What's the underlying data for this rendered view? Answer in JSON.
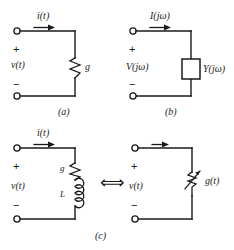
{
  "figure": {
    "background": "#ffffff",
    "ink": "#1a1a1a",
    "panels": [
      {
        "id": "a",
        "caption": "(a)",
        "current_label": "i(t)",
        "voltage_label": "v(t)",
        "plus_sign": "+",
        "minus_sign": "−",
        "element_label": "g",
        "element_type": "resistor-zigzag"
      },
      {
        "id": "b",
        "caption": "(b)",
        "current_label": "I(jω)",
        "voltage_label": "V(jω)",
        "plus_sign": "+",
        "minus_sign": "−",
        "element_label": "Y(jω)",
        "element_type": "box"
      },
      {
        "id": "c-left",
        "caption": "(c)",
        "current_label": "i(t)",
        "voltage_label": "v(t)",
        "plus_sign": "+",
        "minus_sign": "−",
        "element_label_top": "g",
        "element_label_bottom": "L",
        "element_type": "resistor-and-inductor"
      },
      {
        "id": "c-right",
        "caption": "",
        "current_label": "",
        "voltage_label": "v(t)",
        "plus_sign": "+",
        "minus_sign": "−",
        "element_label": "g(t)",
        "element_type": "variable-resistor"
      }
    ],
    "equivalence_symbol": "⟺"
  }
}
